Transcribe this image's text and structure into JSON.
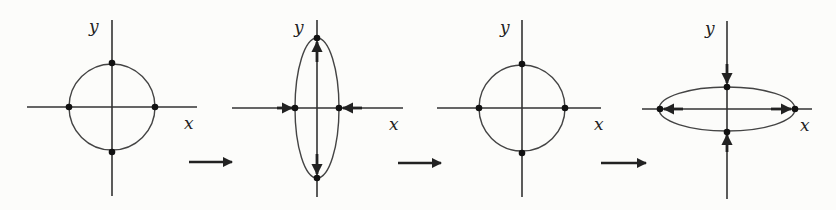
{
  "diagram": {
    "colors": {
      "ink": "#222222",
      "background": "#fcfcfa"
    },
    "panels": [
      {
        "id": "panel-1",
        "shape": "circle",
        "x_label": "x",
        "y_label": "y",
        "force_arrows": "none"
      },
      {
        "id": "panel-2",
        "shape": "vertical-ellipse",
        "x_label": "x",
        "y_label": "y",
        "force_arrows": "outward-vertical, inward-horizontal"
      },
      {
        "id": "panel-3",
        "shape": "circle",
        "x_label": "x",
        "y_label": "y",
        "force_arrows": "none"
      },
      {
        "id": "panel-4",
        "shape": "horizontal-ellipse",
        "x_label": "x",
        "y_label": "y",
        "force_arrows": "outward-horizontal, inward-vertical"
      }
    ],
    "transition_arrows": [
      {
        "from": "panel-1",
        "to": "panel-2",
        "icon": "right-arrow-icon"
      },
      {
        "from": "panel-2",
        "to": "panel-3",
        "icon": "right-arrow-icon"
      },
      {
        "from": "panel-3",
        "to": "panel-4",
        "icon": "right-arrow-icon"
      }
    ]
  }
}
